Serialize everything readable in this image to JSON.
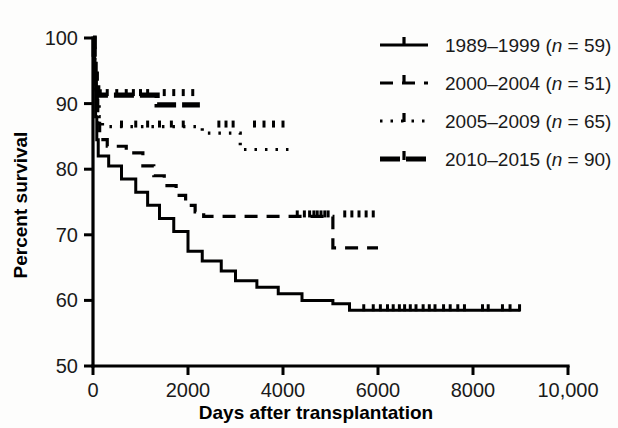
{
  "chart_data": {
    "type": "line",
    "title": "",
    "xlabel": "Days after transplantation",
    "ylabel": "Percent survival",
    "xlim": [
      0,
      10000
    ],
    "ylim": [
      50,
      100
    ],
    "xticks": [
      0,
      2000,
      4000,
      6000,
      8000,
      10000
    ],
    "xtick_labels": [
      "0",
      "2000",
      "4000",
      "6000",
      "8000",
      "10,000"
    ],
    "yticks": [
      50,
      60,
      70,
      80,
      90,
      100
    ],
    "ytick_labels": [
      "50",
      "60",
      "70",
      "80",
      "90",
      "100"
    ],
    "grid": false,
    "legend_position": "top-right",
    "plot_kind": "kaplan-meier-survival",
    "series": [
      {
        "name": "1989-1999",
        "label": "1989–1999 (n = 59)",
        "n": 59,
        "linestyle": "solid",
        "color": "#000000",
        "steps": [
          [
            0,
            100
          ],
          [
            30,
            93
          ],
          [
            55,
            88
          ],
          [
            80,
            84.5
          ],
          [
            110,
            82
          ],
          [
            330,
            80.5
          ],
          [
            600,
            78.5
          ],
          [
            900,
            76.5
          ],
          [
            1150,
            74.5
          ],
          [
            1400,
            72.5
          ],
          [
            1700,
            70.5
          ],
          [
            2000,
            67.5
          ],
          [
            2300,
            66
          ],
          [
            2700,
            64.5
          ],
          [
            3000,
            63
          ],
          [
            3450,
            62
          ],
          [
            3900,
            61
          ],
          [
            4400,
            60
          ],
          [
            5050,
            59.5
          ],
          [
            5400,
            58.5
          ],
          [
            9000,
            58.5
          ]
        ],
        "censor_days": [
          5700,
          5900,
          6050,
          6200,
          6320,
          6450,
          6560,
          6680,
          6800,
          6950,
          7080,
          7200,
          7380,
          7520,
          7680,
          7820,
          8200,
          8320,
          8620,
          8780,
          8980
        ],
        "censor_value": 58.5
      },
      {
        "name": "2000-2004",
        "label": "2000–2004 (n = 51)",
        "n": 51,
        "linestyle": "dashed",
        "color": "#000000",
        "steps": [
          [
            0,
            100
          ],
          [
            40,
            94
          ],
          [
            70,
            90.5
          ],
          [
            100,
            87
          ],
          [
            140,
            84.5
          ],
          [
            300,
            83.5
          ],
          [
            700,
            82.5
          ],
          [
            1050,
            80.5
          ],
          [
            1280,
            79
          ],
          [
            1500,
            77.5
          ],
          [
            1750,
            76
          ],
          [
            1950,
            74.5
          ],
          [
            2150,
            73.5
          ],
          [
            2330,
            72.8
          ],
          [
            5000,
            72.8
          ],
          [
            5050,
            68
          ],
          [
            6000,
            68
          ]
        ],
        "censor_days": [
          4300,
          4450,
          4560,
          4650,
          4720,
          4800,
          4880,
          4950,
          5300,
          5450,
          5600,
          5750,
          5900
        ],
        "censor_value": 72.8
      },
      {
        "name": "2005-2009",
        "label": "2005–2009 (n = 65)",
        "n": 65,
        "linestyle": "dotted",
        "color": "#000000",
        "steps": [
          [
            0,
            100
          ],
          [
            35,
            95
          ],
          [
            60,
            92
          ],
          [
            90,
            89.5
          ],
          [
            130,
            88
          ],
          [
            200,
            86.5
          ],
          [
            2200,
            86.5
          ],
          [
            2300,
            85.5
          ],
          [
            3050,
            85.5
          ],
          [
            3100,
            83
          ],
          [
            4150,
            83
          ]
        ],
        "censor_days": [
          600,
          900,
          1150,
          1400,
          1650,
          1900,
          2650,
          2800,
          2950,
          3400,
          3600,
          3800,
          4000
        ],
        "censor_value": 86.5
      },
      {
        "name": "2010-2015",
        "label": "2010–2015 (n = 90)",
        "n": 90,
        "linestyle": "dashdot",
        "color": "#000000",
        "steps": [
          [
            0,
            100
          ],
          [
            25,
            96.5
          ],
          [
            45,
            94.5
          ],
          [
            70,
            93
          ],
          [
            100,
            91.8
          ],
          [
            130,
            91.3
          ],
          [
            1300,
            91.3
          ],
          [
            1350,
            89.8
          ],
          [
            2250,
            89.8
          ]
        ],
        "censor_days": [
          300,
          500,
          700,
          850,
          1000,
          1150,
          1500,
          1700,
          1900,
          2100
        ],
        "censor_value": 91.3
      }
    ]
  },
  "axes": {
    "x_title": "Days after transplantation",
    "y_title": "Percent survival"
  },
  "legend": {
    "entries": [
      {
        "label": "1989–1999 (n = 59)",
        "style": "solid"
      },
      {
        "label": "2000–2004 (n = 51)",
        "style": "dashed"
      },
      {
        "label": "2005–2009 (n = 65)",
        "style": "dotted"
      },
      {
        "label": "2010–2015 (n = 90)",
        "style": "dashdot"
      }
    ]
  }
}
